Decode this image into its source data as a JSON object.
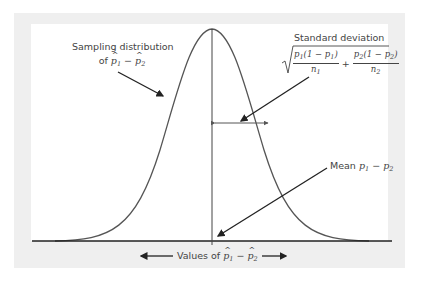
{
  "diagram": {
    "labels": {
      "sampling_line1": "Sampling distribution",
      "sampling_of": "of ",
      "sampling_expr": "p̂1 − p̂2",
      "sd_title": "Standard deviation",
      "sd_formula": "√( p1(1 − p1)/n1 + p2(1 − p2)/n2 )",
      "sd_num1": "p1(1 − p1)",
      "sd_den1": "n1",
      "sd_num2": "p2(1 − p2)",
      "sd_den2": "n2",
      "plus": "+",
      "mean_prefix": "Mean ",
      "mean_expr": "p1 − p2",
      "axis_prefix": "Values of ",
      "axis_expr": "p̂1 − p̂2"
    },
    "colors": {
      "frame": "#efefef",
      "curve": "#555555",
      "axis": "#222222",
      "text": "#444444"
    }
  }
}
